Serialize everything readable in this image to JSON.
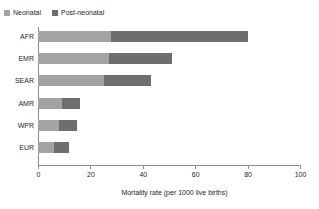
{
  "chart_data": {
    "type": "bar",
    "orientation": "horizontal",
    "stacked": true,
    "xlabel": "Mortality rate (per 1000 live births)",
    "ylabel": "",
    "categories": [
      "AFR",
      "EMR",
      "SEAR",
      "AMR",
      "WPR",
      "EUR"
    ],
    "series": [
      {
        "name": "Neonatal",
        "color": "#a3a3a3",
        "values": [
          28,
          27,
          25,
          9,
          8,
          6
        ]
      },
      {
        "name": "Post-neonatal",
        "color": "#6e6e6e",
        "values": [
          52,
          24,
          18,
          7,
          7,
          6
        ]
      }
    ],
    "totals": [
      80,
      51,
      43,
      16,
      15,
      12
    ],
    "xlim": [
      0,
      100
    ],
    "xticks": [
      0,
      20,
      40,
      60,
      80,
      100
    ],
    "grid": false,
    "legend_position": "top-left",
    "axis_color": "#8c8c8c"
  },
  "legend": {
    "items": [
      {
        "label": "Neonatal"
      },
      {
        "label": "Post-neonatal"
      }
    ]
  }
}
